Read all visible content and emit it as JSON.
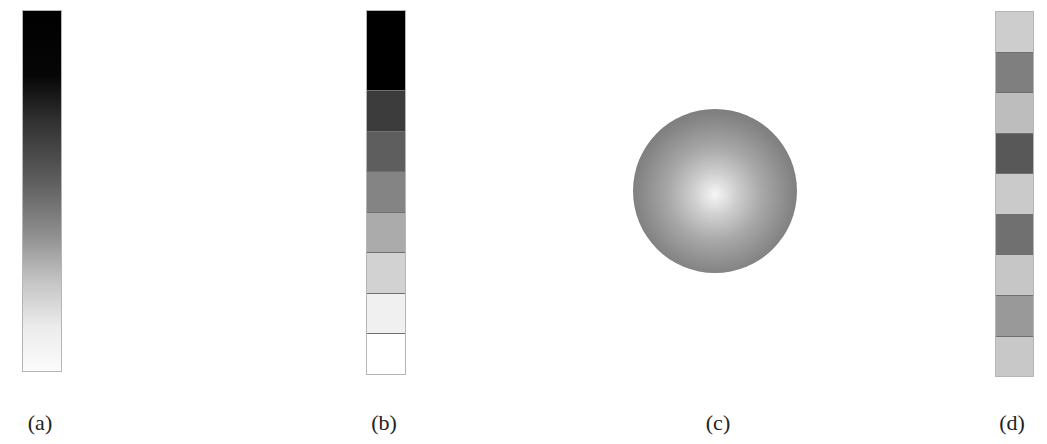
{
  "figure": {
    "panels": [
      {
        "id": "a",
        "label": "(a)",
        "kind": "continuous-gradient-bar",
        "description": "black to white smooth gradient"
      },
      {
        "id": "b",
        "label": "(b)",
        "kind": "discrete-sequential-bar",
        "segments": [
          "#000000",
          "#3c3c3c",
          "#5e5e5e",
          "#848484",
          "#ababab",
          "#d2d2d2",
          "#f0f0f0",
          "#ffffff"
        ]
      },
      {
        "id": "c",
        "label": "(c)",
        "kind": "radial-shaded-sphere",
        "center_color": "#f6f6f6",
        "edge_color": "#5e5e5e"
      },
      {
        "id": "d",
        "label": "(d)",
        "kind": "discrete-qualitative-bar",
        "segments": [
          "#cdcdcd",
          "#7f7f7f",
          "#bdbdbd",
          "#585858",
          "#cacaca",
          "#707070",
          "#c6c6c6",
          "#999999",
          "#c8c8c8"
        ]
      }
    ]
  }
}
